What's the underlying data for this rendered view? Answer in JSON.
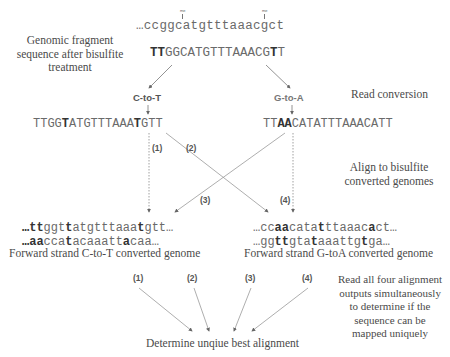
{
  "left_labels": {
    "genomic_fragment": [
      "Genomic fragment",
      "sequence after bisulfite",
      "treatment"
    ]
  },
  "genomic": {
    "top_sequence": "…ccggcatgtttaaacgct",
    "methylation_marks": [
      "me",
      "me"
    ],
    "converted_read": {
      "bold_prefix": "TT",
      "middle": "GGCATGTTTAAACG",
      "bold_t": "T",
      "end": "T"
    }
  },
  "conversions": {
    "c_to_t": "C-to-T",
    "g_to_a": "G-to-A"
  },
  "reads": {
    "ct_read": {
      "p1": "TTGG",
      "b1": "T",
      "p2": "ATGTTTAAA",
      "b2": "T",
      "p3": "GTT"
    },
    "ga_read": {
      "p1": "TT",
      "b1": "AA",
      "p2": "CATATTTAAACATT"
    }
  },
  "alignment_labels": {
    "a1": "(1)",
    "a2": "(2)",
    "a3": "(3)",
    "a4": "(4)"
  },
  "genomes": {
    "ct": {
      "line1": {
        "b0": "…tt",
        "p1": "ggt",
        "b1": "t",
        "p2": "atgtttaaa",
        "b2": "t",
        "p3": "gtt…"
      },
      "line2": {
        "b0": "…aa",
        "p1": "cca",
        "b1": "t",
        "p2": "acaaatt",
        "b2": "a",
        "p3": "caa…"
      },
      "caption": "Forward strand C-to-T converted genome"
    },
    "ga": {
      "line1": {
        "p0": "…cc",
        "b0": "aa",
        "p1": "cata",
        "b1": "t",
        "p2": "ttaaac",
        "b2": "a",
        "p3": "ct…"
      },
      "line2": {
        "p0": "…gg",
        "b0": "tt",
        "p1": "gta",
        "b1": "t",
        "p2": "aaattg",
        "b2": "t",
        "p3": "ga…"
      },
      "caption": "Forward strand G-toA converted genome"
    }
  },
  "right_labels": {
    "read_conversion": "Read conversion",
    "align": [
      "Align to bisulfite",
      "converted genomes"
    ],
    "read_all": [
      "Read all four alignment",
      "outputs simultaneously",
      "to determine if the",
      "sequence can be",
      "mapped uniquely"
    ]
  },
  "bottom": {
    "outputs": [
      "(1)",
      "(2)",
      "(3)",
      "(4)"
    ],
    "result": "Determine unqiue best alignment"
  },
  "colors": {
    "line": "#8a8a8a",
    "text": "#4a4a4a"
  }
}
